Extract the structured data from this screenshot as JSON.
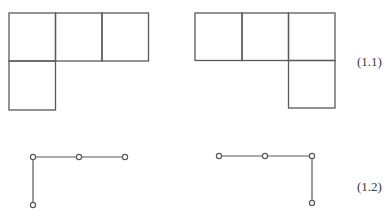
{
  "colors": {
    "stroke": "#5a5a5a",
    "node_fill": "#ffffff",
    "text": "#3a3a3a"
  },
  "figure_1_1": {
    "label": "(1.1)",
    "shapes": [
      {
        "name": "left-L-tromino",
        "cells": [
          [
            0,
            0
          ],
          [
            1,
            0
          ],
          [
            2,
            0
          ],
          [
            0,
            1
          ]
        ]
      },
      {
        "name": "right-L-tromino",
        "cells": [
          [
            0,
            0
          ],
          [
            1,
            0
          ],
          [
            2,
            0
          ],
          [
            2,
            1
          ]
        ]
      }
    ]
  },
  "figure_1_2": {
    "label": "(1.2)",
    "graphs": [
      {
        "name": "left-path-graph",
        "nodes": [
          [
            0,
            0
          ],
          [
            1,
            0
          ],
          [
            2,
            0
          ],
          [
            0,
            1
          ]
        ],
        "edges": [
          [
            0,
            1
          ],
          [
            1,
            2
          ],
          [
            0,
            3
          ]
        ]
      },
      {
        "name": "right-path-graph",
        "nodes": [
          [
            0,
            0
          ],
          [
            1,
            0
          ],
          [
            2,
            0
          ],
          [
            2,
            1
          ]
        ],
        "edges": [
          [
            0,
            1
          ],
          [
            1,
            2
          ],
          [
            2,
            3
          ]
        ]
      }
    ]
  }
}
